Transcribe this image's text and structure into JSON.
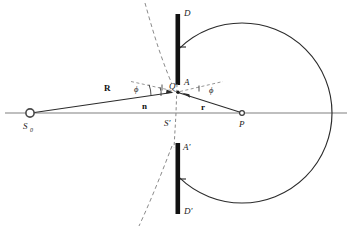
{
  "figure": {
    "type": "optics-ray-diagram",
    "colors": {
      "line": "#2b2b2b",
      "axis": "#6f6f6f",
      "barrier": "#111111",
      "dashed": "#7a7a7a",
      "background": "#ffffff"
    },
    "labels": {
      "source": "S",
      "source_sub": "0",
      "barrier_top": "D",
      "barrier_bottom": "D'",
      "aperture_top": "A",
      "aperture_bottom": "A'",
      "aperture_point": "Q",
      "axis_point": "S'",
      "observation_point": "P",
      "vector_R": "R",
      "vector_n": "n",
      "vector_r": "r",
      "angle_left": "ϕ",
      "angle_right": "ϕ"
    },
    "geometry": {
      "source_point": [
        30,
        113
      ],
      "aperture_point_Q": [
        178,
        92
      ],
      "axis_point_S": [
        178,
        113
      ],
      "observation_point_P": [
        242,
        113
      ],
      "circle_center": [
        242,
        113
      ],
      "circle_radius": 90,
      "barrier_x": 178,
      "aperture_top_y": 85,
      "aperture_bottom_y": 143,
      "axis_y": 113,
      "axis_x_start": 5,
      "axis_x_end": 347
    }
  }
}
